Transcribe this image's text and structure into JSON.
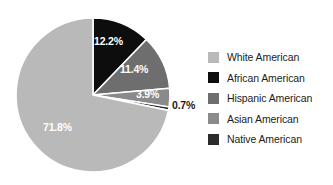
{
  "chart_data": {
    "type": "pie",
    "title": "",
    "subtitle": "",
    "xlabel": "",
    "ylabel": "",
    "grid": false,
    "legend_position": "right",
    "start_angle_deg": 0,
    "direction": "clockwise",
    "categories": [
      "White American",
      "African American",
      "Hispanic American",
      "Asian American",
      "Native American"
    ],
    "values": [
      71.8,
      12.2,
      11.4,
      3.9,
      0.7
    ],
    "value_labels": [
      "71.8%",
      "12.2%",
      "11.4%",
      "3.9%",
      "0.7%"
    ],
    "colors": [
      "#b9b9b9",
      "#0d0d0d",
      "#6e6e6e",
      "#8a8a8a",
      "#222222"
    ],
    "slices": [
      {
        "name": "African American",
        "value": 12.2,
        "label": "12.2%",
        "color": "#0d0d0d",
        "label_color": "#ffffff",
        "label_placement": "inside"
      },
      {
        "name": "Hispanic American",
        "value": 11.4,
        "label": "11.4%",
        "color": "#6e6e6e",
        "label_color": "#ffffff",
        "label_placement": "inside"
      },
      {
        "name": "Asian American",
        "value": 3.9,
        "label": "3.9%",
        "color": "#8a8a8a",
        "label_color": "#ffffff",
        "label_placement": "inside"
      },
      {
        "name": "Native American",
        "value": 0.7,
        "label": "0.7%",
        "color": "#222222",
        "label_color": "#1a1a1a",
        "label_placement": "outside"
      },
      {
        "name": "White American",
        "value": 71.8,
        "label": "71.8%",
        "color": "#b9b9b9",
        "label_color": "#ffffff",
        "label_placement": "inside"
      }
    ]
  },
  "legend": {
    "items": [
      {
        "label": "White American",
        "color": "#b9b9b9"
      },
      {
        "label": "African American",
        "color": "#0d0d0d"
      },
      {
        "label": "Hispanic American",
        "color": "#6e6e6e"
      },
      {
        "label": "Asian American",
        "color": "#8a8a8a"
      },
      {
        "label": "Native American",
        "color": "#2b2b2b"
      }
    ]
  }
}
